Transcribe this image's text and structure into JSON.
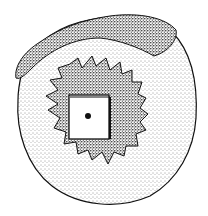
{
  "illustration": {
    "subject": "stippled drawing of a round stone disc with a toothed ratchet ring and a square central hole",
    "background": "#ffffff",
    "ink": "#1a1a1a",
    "gear_teeth": 18
  }
}
